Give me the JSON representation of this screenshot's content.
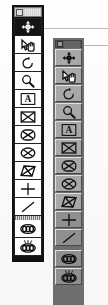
{
  "app": {
    "title": "Toolbar Palettes",
    "description": "Two floating vertical tool palettes from a drawing/CAD application",
    "palette_count": 2
  },
  "colors": {
    "left_frame": "#111111",
    "left_button_face": "#ffffff",
    "left_button_selected": "#141414",
    "left_titlebar": "#c9c9c9",
    "right_frame": "#6e6e6e",
    "right_button_face": "#a8a8a8",
    "right_button_dim": "#8f8f8f",
    "right_titlebar": "#5a5a5a",
    "rule_line": "#b9b9b9",
    "ink_dark": "#101010",
    "ink_light": "#f2f2f2"
  },
  "palettes": [
    {
      "id": "left",
      "name": "Tool Palette (flat style)",
      "titlebar": {
        "control_icon": "window-restore-icon",
        "label": ""
      },
      "selected_index": 0,
      "tools": [
        {
          "icon": "pan-move-icon",
          "label": "Pan / Move",
          "selected": true
        },
        {
          "icon": "hand-select-icon",
          "label": "Select with Hand",
          "selected": false
        },
        {
          "icon": "rotate-icon",
          "label": "Rotate",
          "selected": false
        },
        {
          "icon": "zoom-magnifier-icon",
          "label": "Zoom",
          "selected": false
        },
        {
          "icon": "text-box-icon",
          "label": "Text Box",
          "selected": false
        },
        {
          "icon": "rectangle-x-icon",
          "label": "Rectangle Region",
          "selected": false
        },
        {
          "icon": "rounded-rect-x-icon",
          "label": "Rounded Region",
          "selected": false
        },
        {
          "icon": "ellipse-x-icon",
          "label": "Ellipse Region",
          "selected": false
        },
        {
          "icon": "parallelogram-x-icon",
          "label": "Skewed Region",
          "selected": false
        },
        {
          "icon": "crosshair-plus-icon",
          "label": "Point / Crosshair",
          "selected": false
        },
        {
          "icon": "diagonal-line-icon",
          "label": "Line",
          "selected": false
        },
        {
          "icon": "separator",
          "label": "Separator",
          "selected": false
        },
        {
          "icon": "chain-links-icon",
          "label": "Link Objects",
          "selected": false
        },
        {
          "icon": "burst-links-icon",
          "label": "Explode / Unlink",
          "selected": false
        }
      ]
    },
    {
      "id": "right",
      "name": "Tool Palette (3D bevel style)",
      "titlebar": {
        "control_icon": "window-restore-icon",
        "label": ""
      },
      "selected_index": -1,
      "tools": [
        {
          "icon": "pan-move-icon",
          "label": "Pan / Move",
          "dim": false
        },
        {
          "icon": "hand-select-icon",
          "label": "Select with Hand",
          "dim": false
        },
        {
          "icon": "rotate-icon",
          "label": "Rotate",
          "dim": false
        },
        {
          "icon": "zoom-magnifier-icon",
          "label": "Zoom",
          "dim": false
        },
        {
          "icon": "text-box-icon",
          "label": "Text Box",
          "dim": false
        },
        {
          "icon": "rectangle-x-icon",
          "label": "Rectangle Region",
          "dim": false
        },
        {
          "icon": "rounded-rect-x-icon",
          "label": "Rounded Region",
          "dim": false
        },
        {
          "icon": "ellipse-x-icon",
          "label": "Ellipse Region",
          "dim": false
        },
        {
          "icon": "parallelogram-x-icon",
          "label": "Skewed Region",
          "dim": false
        },
        {
          "icon": "crosshair-plus-icon",
          "label": "Point / Crosshair",
          "dim": true
        },
        {
          "icon": "diagonal-line-icon",
          "label": "Line",
          "dim": true
        },
        {
          "icon": "separator",
          "label": "Separator",
          "dim": false
        },
        {
          "icon": "chain-links-icon",
          "label": "Link Objects",
          "dim": true
        },
        {
          "icon": "burst-links-icon",
          "label": "Explode / Unlink",
          "dim": true
        }
      ]
    }
  ],
  "rules": [
    {
      "name": "callout-rule-top",
      "from_palette": "left",
      "y": 28
    },
    {
      "name": "callout-rule-bottom",
      "from_palette": "right",
      "y": 45
    }
  ],
  "text_glyphs": {
    "text_tool_letter": "A"
  }
}
